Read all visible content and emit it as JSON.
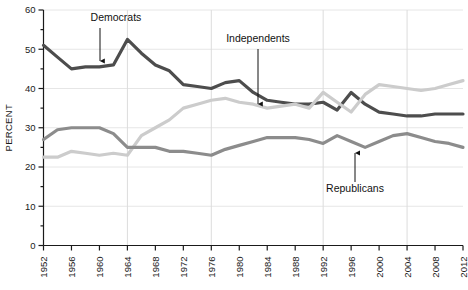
{
  "chart_data": {
    "type": "line",
    "title": "",
    "xlabel": "",
    "ylabel": "PERCENT",
    "ylim": [
      0,
      60
    ],
    "ytick_labels": [
      "0",
      "10",
      "20",
      "30",
      "40",
      "50",
      "60"
    ],
    "ytick_values": [
      0,
      10,
      20,
      30,
      40,
      50,
      60
    ],
    "yminor_step": 5,
    "grid": "both",
    "legend_position": "inline-annotations",
    "x": [
      1952,
      1954,
      1956,
      1958,
      1960,
      1962,
      1964,
      1966,
      1968,
      1970,
      1972,
      1974,
      1976,
      1978,
      1980,
      1982,
      1984,
      1986,
      1988,
      1990,
      1992,
      1994,
      1996,
      1998,
      2000,
      2002,
      2004,
      2006,
      2008,
      2010,
      2012
    ],
    "xtick_labels": [
      "1952",
      "1956",
      "1960",
      "1964",
      "1968",
      "1972",
      "1976",
      "1980",
      "1984",
      "1988",
      "1992",
      "1996",
      "2000",
      "2004",
      "2008",
      "2012"
    ],
    "xtick_values": [
      1952,
      1956,
      1960,
      1964,
      1968,
      1972,
      1976,
      1980,
      1984,
      1988,
      1992,
      1996,
      2000,
      2004,
      2008,
      2012
    ],
    "xlim": [
      1952,
      2012
    ],
    "vertical_gridlines": [
      1964,
      1976,
      1992,
      2004
    ],
    "series": [
      {
        "name": "Democrats",
        "color": "#4d4d4d",
        "values": [
          51.0,
          48.0,
          45.0,
          45.5,
          45.5,
          46.0,
          52.5,
          49.0,
          46.0,
          44.5,
          41.0,
          40.5,
          40.0,
          41.5,
          42.0,
          39.0,
          37.0,
          36.5,
          36.0,
          36.0,
          36.5,
          34.5,
          39.0,
          36.0,
          34.0,
          33.5,
          33.0,
          33.0,
          33.5,
          33.5,
          33.5
        ]
      },
      {
        "name": "Independents",
        "color": "#cccccc",
        "values": [
          22.5,
          22.5,
          24.0,
          23.5,
          23.0,
          23.5,
          23.0,
          28.0,
          30.0,
          32.0,
          35.0,
          36.0,
          37.0,
          37.5,
          36.5,
          36.0,
          35.0,
          35.5,
          36.0,
          35.0,
          39.0,
          36.5,
          34.0,
          38.5,
          41.0,
          40.5,
          40.0,
          39.5,
          40.0,
          41.0,
          42.0
        ]
      },
      {
        "name": "Republicans",
        "color": "#8c8c8c",
        "values": [
          27.0,
          29.5,
          30.0,
          30.0,
          30.0,
          28.5,
          25.0,
          25.0,
          25.0,
          24.0,
          24.0,
          23.5,
          23.0,
          24.5,
          25.5,
          26.5,
          27.5,
          27.5,
          27.5,
          27.0,
          26.0,
          28.0,
          26.5,
          25.0,
          26.5,
          28.0,
          28.5,
          27.5,
          26.5,
          26.0,
          25.0
        ]
      }
    ],
    "annotations": [
      {
        "label": "Democrats",
        "text_x": 116,
        "text_y": 21,
        "arrow_x": 100,
        "arrow_y1": 28,
        "arrow_y2": 61
      },
      {
        "label": "Independents",
        "text_x": 258,
        "text_y": 42,
        "arrow_x": 258,
        "arrow_y1": 49,
        "arrow_y2": 104
      },
      {
        "label": "Republicans",
        "text_x": 355,
        "text_y": 192,
        "arrow_x": 355,
        "arrow_y1": 182,
        "arrow_y2": 153
      }
    ]
  }
}
